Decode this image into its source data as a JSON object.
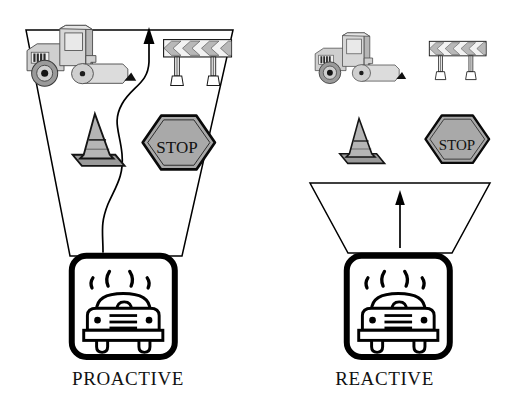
{
  "figure": {
    "title_visible": false,
    "background_color": "#ffffff",
    "ink_color": "#000000",
    "panels": [
      {
        "id": "proactive",
        "caption": "PROACTIVE",
        "funnel": {
          "shape": "tall-wide-funnel",
          "description": "Tall wide funnel narrowing down to the vehicle icon",
          "fill": "#ffffff",
          "stroke": "#000000"
        },
        "flow_indicator": {
          "type": "wavy-line-with-arrow",
          "direction": "upward",
          "description": "Long winding S-curve path rising from the car to an arrowhead at the funnel top"
        },
        "items": [
          {
            "name": "road-roller",
            "label": "Road roller / compactor",
            "fill": "#c9c9c9"
          },
          {
            "name": "barricade",
            "label": "Chevron barricade",
            "chevron_count": 3,
            "chevron_direction": "left",
            "fill": "#b3b3b3"
          },
          {
            "name": "traffic-cone",
            "label": "Traffic cone",
            "fill": "#a8a8a8"
          },
          {
            "name": "stop-sign",
            "label": "STOP",
            "shape": "hexagon",
            "fill": "#a9a9a9"
          }
        ],
        "vehicle_icon": {
          "name": "car-front-icon",
          "label": "Car with exhaust marks",
          "frame": "rounded-square",
          "smoke_marks": 4,
          "grille_lines": 3,
          "headlights": 2,
          "wheels": 2
        }
      },
      {
        "id": "reactive",
        "caption": "REACTIVE",
        "funnel": {
          "shape": "short-wide-funnel",
          "description": "Short shallow funnel placed low, just above the vehicle icon",
          "fill": "#ffffff",
          "stroke": "#000000"
        },
        "flow_indicator": {
          "type": "straight-line-with-arrow",
          "direction": "upward",
          "description": "Short straight arrow rising from the car through the shallow funnel"
        },
        "items": [
          {
            "name": "road-roller",
            "label": "Road roller / compactor",
            "fill": "#c9c9c9"
          },
          {
            "name": "barricade",
            "label": "Chevron barricade",
            "chevron_count": 3,
            "chevron_direction": "left",
            "fill": "#b3b3b3"
          },
          {
            "name": "traffic-cone",
            "label": "Traffic cone",
            "fill": "#a8a8a8"
          },
          {
            "name": "stop-sign",
            "label": "STOP",
            "shape": "hexagon",
            "fill": "#a9a9a9"
          }
        ],
        "vehicle_icon": {
          "name": "car-front-icon",
          "label": "Car with exhaust marks",
          "frame": "rounded-square",
          "smoke_marks": 4,
          "grille_lines": 3,
          "headlights": 2,
          "wheels": 2
        }
      }
    ],
    "stop_sign_text": "STOP",
    "colors": {
      "outline": "#000000",
      "cone_light": "#b5b5b5",
      "cone_dark": "#9a9a9a",
      "sign_gray": "#a9a9a9",
      "roller_gray": "#cfcfcf",
      "roller_gray_dark": "#a6a6a6",
      "chevron_gray": "#b8b8b8",
      "page_bg": "#ffffff"
    }
  }
}
